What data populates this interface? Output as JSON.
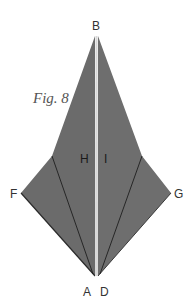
{
  "figure": {
    "caption": "Fig. 8",
    "labels": {
      "B": "B",
      "F": "F",
      "G": "G",
      "A": "A",
      "D": "D",
      "H": "H",
      "I": "I"
    },
    "colors": {
      "fill": "#6b6b6b",
      "fill_light": "#727272",
      "crease": "#1e1e1e",
      "center_strip": "#d8d8d8",
      "background": "#ffffff"
    }
  }
}
